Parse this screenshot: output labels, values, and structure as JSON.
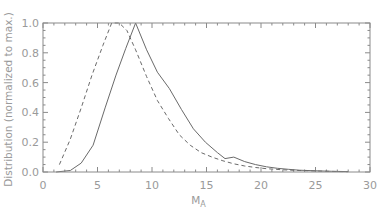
{
  "chart_data": {
    "type": "line",
    "title": "",
    "xlabel": "M_A",
    "xlabel_main": "M",
    "xlabel_sub": "A",
    "ylabel": "Distribution (normalized to max.)",
    "xlim": [
      0,
      30
    ],
    "ylim": [
      0,
      1.0
    ],
    "x_ticks": [
      0,
      5,
      10,
      15,
      20,
      25,
      30
    ],
    "x_tick_labels": [
      "0",
      "5",
      "10",
      "15",
      "20",
      "25",
      "30"
    ],
    "y_ticks": [
      0.0,
      0.2,
      0.4,
      0.6,
      0.8,
      1.0
    ],
    "y_tick_labels": [
      "0.0",
      "0.2",
      "0.4",
      "0.6",
      "0.8",
      "1.0"
    ],
    "grid": false,
    "legend": null,
    "series": [
      {
        "name": "solid",
        "style": "solid",
        "color": "#6a6a6a",
        "x": [
          1.2,
          2.5,
          3.5,
          4.6,
          5.7,
          6.7,
          7.6,
          8.5,
          9.5,
          10.5,
          11.6,
          12.7,
          13.8,
          14.9,
          16.0,
          16.7,
          17.5,
          18.5,
          19.5,
          20.5,
          21.5,
          22.5,
          23.5,
          25.0,
          26.5,
          28.0
        ],
        "y": [
          0.0,
          0.01,
          0.06,
          0.18,
          0.43,
          0.65,
          0.83,
          1.0,
          0.82,
          0.67,
          0.56,
          0.42,
          0.29,
          0.2,
          0.13,
          0.09,
          0.1,
          0.07,
          0.05,
          0.035,
          0.025,
          0.018,
          0.012,
          0.008,
          0.005,
          0.003
        ]
      },
      {
        "name": "dashed",
        "style": "dashed",
        "color": "#6a6a6a",
        "x": [
          1.5,
          2.5,
          3.5,
          4.5,
          5.5,
          6.3,
          7.0,
          7.7,
          8.5,
          9.5,
          10.5,
          11.5,
          12.5,
          13.5,
          14.5,
          15.5,
          16.5,
          17.5,
          18.5,
          19.5,
          20.5,
          22.0,
          23.5,
          25.0,
          26.5,
          28.0
        ],
        "y": [
          0.05,
          0.22,
          0.43,
          0.65,
          0.85,
          1.0,
          1.0,
          0.95,
          0.82,
          0.64,
          0.48,
          0.36,
          0.25,
          0.18,
          0.13,
          0.1,
          0.075,
          0.055,
          0.04,
          0.03,
          0.022,
          0.015,
          0.01,
          0.007,
          0.004,
          0.002
        ]
      }
    ]
  },
  "style": {
    "axis_color": "#8a8a8a",
    "text_color": "#9a9a9a",
    "background": "#ffffff"
  }
}
